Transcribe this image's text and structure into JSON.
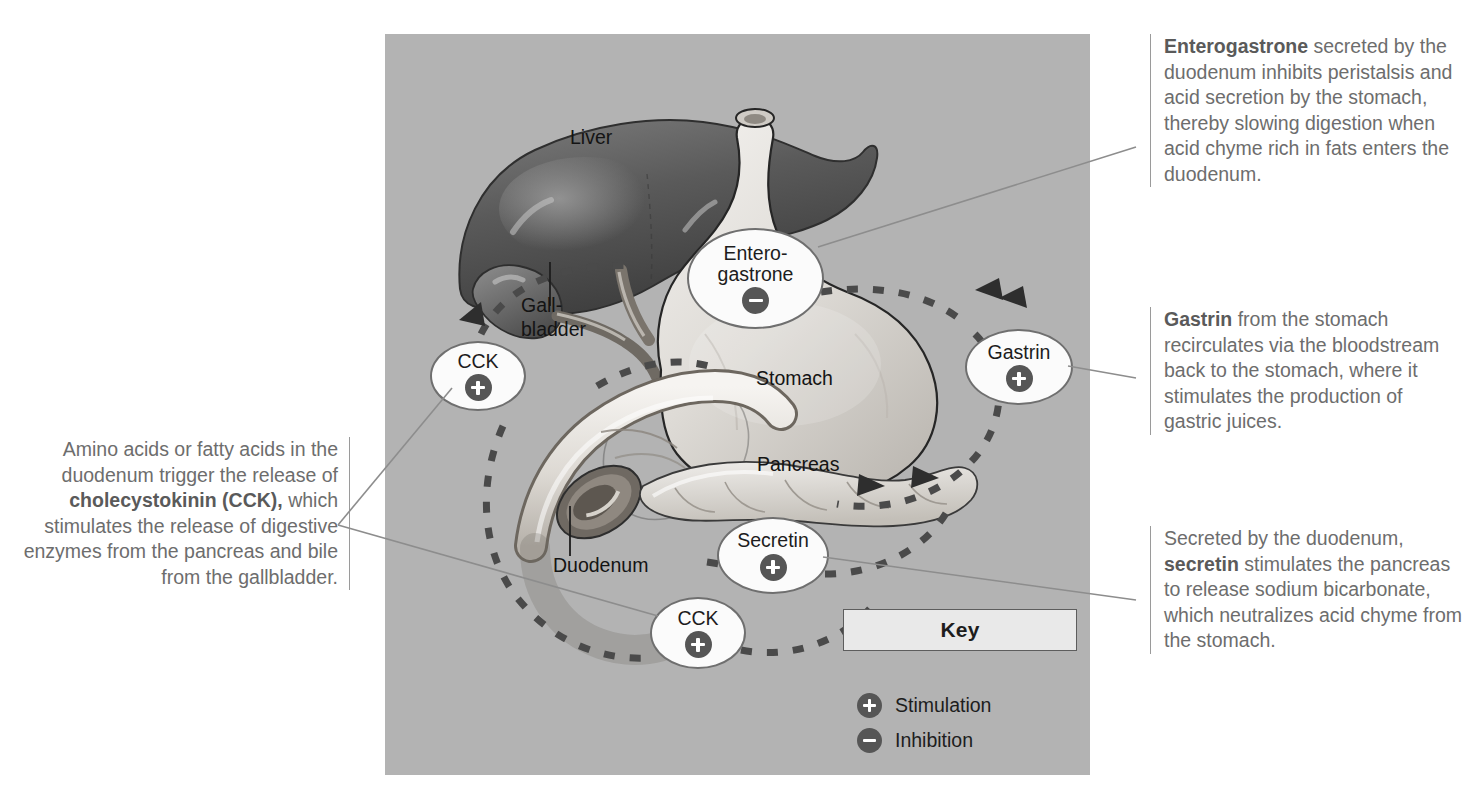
{
  "figure": {
    "panel_bg": "#b3b3b3",
    "accent_dark": "#4a4a4a"
  },
  "organs": [
    {
      "name": "liver",
      "label": "Liver"
    },
    {
      "name": "gallbladder",
      "label": "Gall-\nbladder"
    },
    {
      "name": "stomach",
      "label": "Stomach"
    },
    {
      "name": "pancreas",
      "label": "Pancreas"
    },
    {
      "name": "duodenum",
      "label": "Duodenum"
    }
  ],
  "hormones": [
    {
      "name": "enterogastrone",
      "label": "Entero-\ngastrone",
      "sign": "inhibition"
    },
    {
      "name": "cck-upper",
      "label": "CCK",
      "sign": "stimulation"
    },
    {
      "name": "gastrin",
      "label": "Gastrin",
      "sign": "stimulation"
    },
    {
      "name": "secretin",
      "label": "Secretin",
      "sign": "stimulation"
    },
    {
      "name": "cck-lower",
      "label": "CCK",
      "sign": "stimulation"
    }
  ],
  "key": {
    "title": "Key",
    "stimulation_label": "Stimulation",
    "inhibition_label": "Inhibition",
    "stimulation_symbol": "+",
    "inhibition_symbol": "−"
  },
  "annotations": {
    "enterogastrone": {
      "bold_lead": "Enterogastrone",
      "text": " secreted by the duodenum inhibits peristalsis and acid secretion by the stomach, thereby slowing digestion when acid chyme rich in fats enters the duodenum."
    },
    "gastrin": {
      "bold_lead": "Gastrin",
      "text": " from the stomach recirculates via the bloodstream back to the stomach, where it stimulates the production of gastric juices."
    },
    "secretin": {
      "part1": "Secreted by the duodenum, ",
      "bold_mid": "secretin",
      "part2": " stimulates the pancreas to release sodium bicarbonate, which neutralizes acid chyme from the stomach."
    },
    "cck": {
      "part1": "Amino acids or fatty acids in the duodenum trigger the release of ",
      "bold_mid": "cholecystokinin (CCK),",
      "part2": " which stimulates the release of digestive enzymes from the pancreas and bile from the gallbladder."
    }
  }
}
